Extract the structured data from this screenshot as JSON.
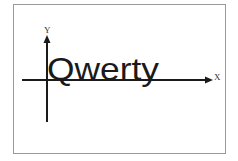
{
  "diagram": {
    "word": "Qwerty",
    "x_axis_label": "X",
    "y_axis_label": "Y",
    "colors": {
      "axis": "#1a1a1a",
      "text": "#1a1a1a",
      "frame": "#9a9a9a",
      "background": "#ffffff"
    }
  }
}
